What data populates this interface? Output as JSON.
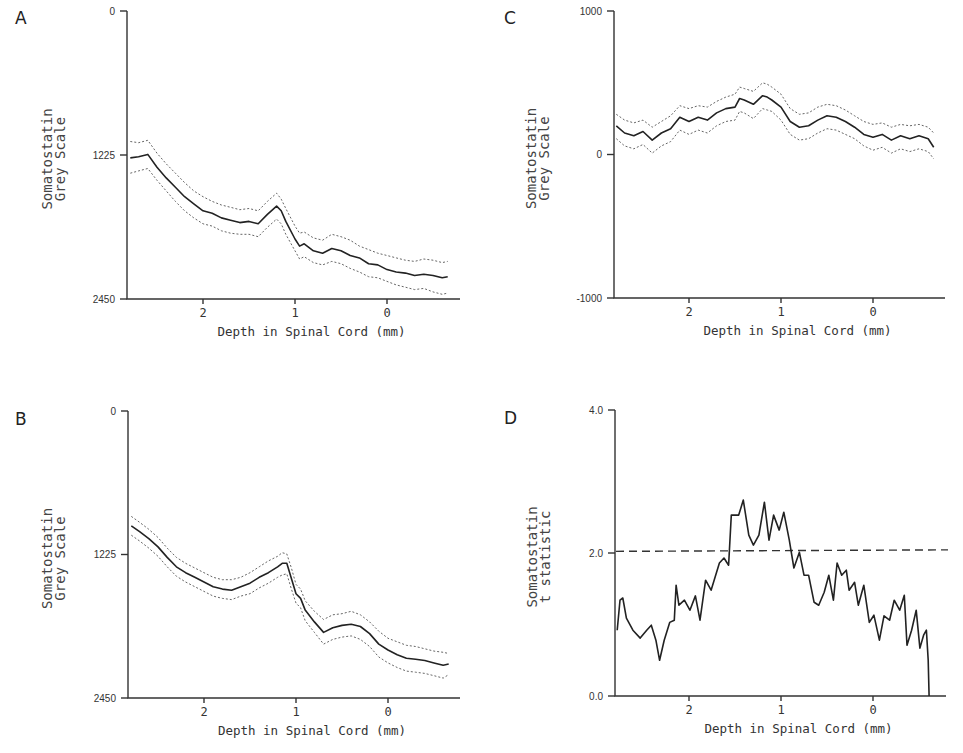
{
  "figure": {
    "x_axis_title": "Depth in Spinal Cord (mm)",
    "x_ticks": [
      "2",
      "1",
      "0"
    ]
  },
  "chart_data": [
    {
      "panel": "A",
      "type": "line",
      "title": "",
      "xlabel": "Depth in Spinal Cord (mm)",
      "ylabel": [
        "Somatostatin",
        "Grey Scale"
      ],
      "y_ticks": [
        "0",
        "1225",
        "2450"
      ],
      "ylim": [
        0,
        2450
      ],
      "y_inverted": true,
      "xlim": [
        2.8,
        -0.7
      ],
      "x_ticks": [
        2,
        1,
        0
      ],
      "grid": false,
      "series": [
        {
          "name": "mean",
          "style": "solid",
          "x": [
            2.79,
            2.7,
            2.6,
            2.5,
            2.4,
            2.3,
            2.2,
            2.1,
            2.0,
            1.9,
            1.8,
            1.7,
            1.6,
            1.5,
            1.4,
            1.3,
            1.2,
            1.15,
            1.1,
            1.0,
            0.95,
            0.9,
            0.8,
            0.7,
            0.6,
            0.5,
            0.4,
            0.3,
            0.2,
            0.1,
            0.0,
            -0.1,
            -0.2,
            -0.3,
            -0.4,
            -0.5,
            -0.6,
            -0.66
          ],
          "values": [
            1250,
            1240,
            1220,
            1330,
            1420,
            1500,
            1580,
            1640,
            1700,
            1720,
            1760,
            1780,
            1800,
            1790,
            1810,
            1730,
            1660,
            1700,
            1790,
            1940,
            2000,
            1980,
            2040,
            2060,
            2020,
            2040,
            2080,
            2100,
            2150,
            2160,
            2200,
            2220,
            2230,
            2250,
            2240,
            2250,
            2270,
            2260
          ]
        },
        {
          "name": "upper",
          "style": "dotted",
          "x": [
            2.79,
            2.7,
            2.6,
            2.5,
            2.4,
            2.3,
            2.2,
            2.1,
            2.0,
            1.9,
            1.8,
            1.7,
            1.6,
            1.5,
            1.4,
            1.3,
            1.2,
            1.15,
            1.1,
            1.0,
            0.95,
            0.9,
            0.8,
            0.7,
            0.6,
            0.5,
            0.4,
            0.3,
            0.2,
            0.1,
            0.0,
            -0.1,
            -0.2,
            -0.3,
            -0.4,
            -0.5,
            -0.6,
            -0.66
          ],
          "values": [
            1110,
            1120,
            1100,
            1210,
            1300,
            1380,
            1460,
            1530,
            1580,
            1620,
            1650,
            1670,
            1690,
            1680,
            1700,
            1620,
            1550,
            1600,
            1680,
            1830,
            1890,
            1880,
            1930,
            1950,
            1900,
            1920,
            1950,
            2000,
            2030,
            2060,
            2080,
            2100,
            2120,
            2130,
            2110,
            2120,
            2140,
            2130
          ]
        },
        {
          "name": "lower",
          "style": "dotted",
          "x": [
            2.79,
            2.7,
            2.6,
            2.5,
            2.4,
            2.3,
            2.2,
            2.1,
            2.0,
            1.9,
            1.8,
            1.7,
            1.6,
            1.5,
            1.4,
            1.3,
            1.2,
            1.15,
            1.1,
            1.0,
            0.95,
            0.9,
            0.8,
            0.7,
            0.6,
            0.5,
            0.4,
            0.3,
            0.2,
            0.1,
            0.0,
            -0.1,
            -0.2,
            -0.3,
            -0.4,
            -0.5,
            -0.6,
            -0.66
          ],
          "values": [
            1380,
            1360,
            1340,
            1440,
            1530,
            1620,
            1700,
            1760,
            1810,
            1830,
            1870,
            1890,
            1900,
            1900,
            1920,
            1840,
            1770,
            1810,
            1900,
            2040,
            2110,
            2090,
            2140,
            2160,
            2130,
            2150,
            2190,
            2220,
            2260,
            2270,
            2300,
            2330,
            2350,
            2370,
            2360,
            2390,
            2410,
            2400
          ]
        }
      ]
    },
    {
      "panel": "B",
      "type": "line",
      "title": "",
      "xlabel": "Depth in Spinal Cord (mm)",
      "ylabel": [
        "Somatostatin",
        "Grey Scale"
      ],
      "y_ticks": [
        "0",
        "1225",
        "2450"
      ],
      "ylim": [
        0,
        2450
      ],
      "y_inverted": true,
      "xlim": [
        2.8,
        -0.7
      ],
      "x_ticks": [
        2,
        1,
        0
      ],
      "grid": false,
      "series": [
        {
          "name": "mean",
          "style": "solid",
          "x": [
            2.79,
            2.7,
            2.6,
            2.5,
            2.4,
            2.3,
            2.2,
            2.1,
            2.0,
            1.9,
            1.8,
            1.7,
            1.6,
            1.5,
            1.4,
            1.3,
            1.2,
            1.15,
            1.1,
            1.05,
            1.0,
            0.95,
            0.9,
            0.8,
            0.7,
            0.6,
            0.5,
            0.4,
            0.3,
            0.2,
            0.1,
            0.0,
            -0.1,
            -0.2,
            -0.3,
            -0.4,
            -0.5,
            -0.6,
            -0.66
          ],
          "values": [
            980,
            1030,
            1090,
            1160,
            1250,
            1330,
            1380,
            1420,
            1460,
            1500,
            1520,
            1530,
            1500,
            1470,
            1420,
            1380,
            1330,
            1300,
            1300,
            1430,
            1560,
            1600,
            1700,
            1800,
            1890,
            1850,
            1830,
            1820,
            1840,
            1900,
            1990,
            2040,
            2080,
            2110,
            2120,
            2130,
            2150,
            2170,
            2160
          ]
        },
        {
          "name": "upper",
          "style": "dotted",
          "x": [
            2.79,
            2.7,
            2.6,
            2.5,
            2.4,
            2.3,
            2.2,
            2.1,
            2.0,
            1.9,
            1.8,
            1.7,
            1.6,
            1.5,
            1.4,
            1.3,
            1.2,
            1.15,
            1.1,
            1.05,
            1.0,
            0.95,
            0.9,
            0.8,
            0.7,
            0.6,
            0.5,
            0.4,
            0.3,
            0.2,
            0.1,
            0.0,
            -0.1,
            -0.2,
            -0.3,
            -0.4,
            -0.5,
            -0.6,
            -0.66
          ],
          "values": [
            900,
            950,
            1010,
            1080,
            1170,
            1250,
            1300,
            1340,
            1380,
            1420,
            1440,
            1440,
            1420,
            1380,
            1330,
            1280,
            1240,
            1210,
            1220,
            1340,
            1480,
            1520,
            1620,
            1710,
            1780,
            1740,
            1730,
            1710,
            1740,
            1800,
            1880,
            1940,
            1970,
            2000,
            2010,
            2030,
            2050,
            2060,
            2070
          ]
        },
        {
          "name": "lower",
          "style": "dotted",
          "x": [
            2.79,
            2.7,
            2.6,
            2.5,
            2.4,
            2.3,
            2.2,
            2.1,
            2.0,
            1.9,
            1.8,
            1.7,
            1.6,
            1.5,
            1.4,
            1.3,
            1.2,
            1.15,
            1.1,
            1.05,
            1.0,
            0.95,
            0.9,
            0.8,
            0.7,
            0.6,
            0.5,
            0.4,
            0.3,
            0.2,
            0.1,
            0.0,
            -0.1,
            -0.2,
            -0.3,
            -0.4,
            -0.5,
            -0.6,
            -0.66
          ],
          "values": [
            1060,
            1110,
            1170,
            1240,
            1330,
            1410,
            1460,
            1500,
            1540,
            1580,
            1600,
            1610,
            1580,
            1560,
            1510,
            1470,
            1420,
            1400,
            1390,
            1520,
            1640,
            1680,
            1790,
            1890,
            1990,
            1950,
            1930,
            1920,
            1950,
            2010,
            2100,
            2150,
            2190,
            2220,
            2230,
            2240,
            2260,
            2280,
            2250
          ]
        }
      ]
    },
    {
      "panel": "C",
      "type": "line",
      "title": "",
      "xlabel": "Depth in Spinal Cord (mm)",
      "ylabel": [
        "Somatostatin",
        "Grey Scale"
      ],
      "y_ticks": [
        "1000",
        "0",
        "-1000"
      ],
      "ylim": [
        -1000,
        1000
      ],
      "y_inverted": false,
      "xlim": [
        2.8,
        -0.7
      ],
      "x_ticks": [
        2,
        1,
        0
      ],
      "grid": false,
      "series": [
        {
          "name": "mean",
          "style": "solid",
          "x": [
            2.79,
            2.7,
            2.6,
            2.5,
            2.4,
            2.3,
            2.2,
            2.1,
            2.0,
            1.9,
            1.8,
            1.7,
            1.6,
            1.5,
            1.45,
            1.4,
            1.3,
            1.2,
            1.15,
            1.1,
            1.0,
            0.9,
            0.8,
            0.7,
            0.6,
            0.5,
            0.4,
            0.3,
            0.2,
            0.1,
            0.0,
            -0.1,
            -0.2,
            -0.3,
            -0.4,
            -0.5,
            -0.6,
            -0.66
          ],
          "values": [
            200,
            150,
            130,
            160,
            100,
            150,
            180,
            260,
            230,
            260,
            240,
            290,
            320,
            330,
            390,
            380,
            350,
            410,
            400,
            380,
            330,
            230,
            190,
            200,
            240,
            270,
            260,
            230,
            190,
            140,
            120,
            140,
            100,
            130,
            110,
            130,
            110,
            50
          ]
        },
        {
          "name": "upper",
          "style": "dotted",
          "x": [
            2.79,
            2.7,
            2.6,
            2.5,
            2.4,
            2.3,
            2.2,
            2.1,
            2.0,
            1.9,
            1.8,
            1.7,
            1.6,
            1.5,
            1.45,
            1.4,
            1.3,
            1.2,
            1.15,
            1.1,
            1.0,
            0.9,
            0.8,
            0.7,
            0.6,
            0.5,
            0.4,
            0.3,
            0.2,
            0.1,
            0.0,
            -0.1,
            -0.2,
            -0.3,
            -0.4,
            -0.5,
            -0.6,
            -0.66
          ],
          "values": [
            280,
            240,
            220,
            240,
            190,
            230,
            270,
            340,
            320,
            340,
            330,
            370,
            400,
            420,
            470,
            460,
            440,
            500,
            490,
            470,
            420,
            320,
            280,
            290,
            330,
            350,
            340,
            310,
            270,
            230,
            210,
            220,
            190,
            210,
            200,
            210,
            190,
            150
          ]
        },
        {
          "name": "lower",
          "style": "dotted",
          "x": [
            2.79,
            2.7,
            2.6,
            2.5,
            2.4,
            2.3,
            2.2,
            2.1,
            2.0,
            1.9,
            1.8,
            1.7,
            1.6,
            1.5,
            1.45,
            1.4,
            1.3,
            1.2,
            1.15,
            1.1,
            1.0,
            0.9,
            0.8,
            0.7,
            0.6,
            0.5,
            0.4,
            0.3,
            0.2,
            0.1,
            0.0,
            -0.1,
            -0.2,
            -0.3,
            -0.4,
            -0.5,
            -0.6,
            -0.66
          ],
          "values": [
            110,
            60,
            40,
            70,
            10,
            60,
            90,
            170,
            140,
            170,
            150,
            200,
            230,
            240,
            300,
            290,
            250,
            320,
            310,
            300,
            240,
            140,
            100,
            110,
            150,
            180,
            170,
            140,
            110,
            60,
            30,
            50,
            10,
            40,
            20,
            40,
            20,
            -30
          ]
        }
      ]
    },
    {
      "panel": "D",
      "type": "line",
      "title": "",
      "xlabel": "Depth in Spinal Cord (mm)",
      "ylabel": [
        "Somatostatin",
        "t statistic"
      ],
      "y_ticks": [
        "4.0",
        "2.0",
        "0.0"
      ],
      "ylim": [
        0,
        4
      ],
      "y_inverted": false,
      "xlim": [
        2.8,
        -0.7
      ],
      "x_ticks": [
        2,
        1,
        0
      ],
      "grid": false,
      "threshold": {
        "value": 2.03,
        "style": "dashed"
      },
      "series": [
        {
          "name": "t statistic",
          "style": "solid",
          "x": [
            2.78,
            2.75,
            2.72,
            2.68,
            2.61,
            2.53,
            2.46,
            2.41,
            2.36,
            2.32,
            2.27,
            2.21,
            2.16,
            2.14,
            2.11,
            2.05,
            1.99,
            1.93,
            1.88,
            1.82,
            1.76,
            1.67,
            1.62,
            1.57,
            1.54,
            1.46,
            1.41,
            1.35,
            1.3,
            1.24,
            1.18,
            1.13,
            1.08,
            1.02,
            0.97,
            0.91,
            0.86,
            0.8,
            0.75,
            0.7,
            0.64,
            0.59,
            0.53,
            0.48,
            0.43,
            0.39,
            0.34,
            0.29,
            0.26,
            0.2,
            0.16,
            0.1,
            0.04,
            -0.01,
            -0.07,
            -0.12,
            -0.18,
            -0.23,
            -0.29,
            -0.34,
            -0.37,
            -0.42,
            -0.47,
            -0.51,
            -0.55,
            -0.58,
            -0.6,
            -0.61
          ],
          "values": [
            0.92,
            1.34,
            1.37,
            1.09,
            0.92,
            0.81,
            0.92,
            0.99,
            0.78,
            0.5,
            0.78,
            1.03,
            1.06,
            1.55,
            1.27,
            1.34,
            1.2,
            1.4,
            1.06,
            1.62,
            1.48,
            1.86,
            1.93,
            1.83,
            2.53,
            2.53,
            2.74,
            2.25,
            2.11,
            2.25,
            2.71,
            2.18,
            2.53,
            2.32,
            2.57,
            2.18,
            1.79,
            2.01,
            1.69,
            1.69,
            1.31,
            1.27,
            1.45,
            1.69,
            1.34,
            1.86,
            1.69,
            1.76,
            1.48,
            1.59,
            1.27,
            1.55,
            1.03,
            1.13,
            0.78,
            1.12,
            1.06,
            1.34,
            1.2,
            1.41,
            0.71,
            0.92,
            1.2,
            0.67,
            0.85,
            0.92,
            0.5,
            0.0
          ]
        }
      ]
    }
  ]
}
